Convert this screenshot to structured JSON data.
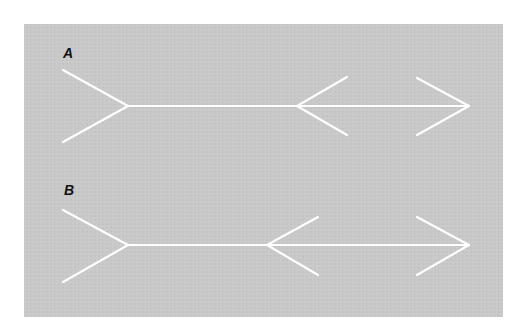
{
  "figure": {
    "background_color": "#c9c9c9",
    "line_color": "#ffffff",
    "figures": [
      {
        "label": "A",
        "label_pos": [
          63,
          47
        ],
        "shaft": [
          128,
          106,
          469,
          106
        ],
        "fins": [
          [
            63,
            70,
            128,
            106
          ],
          [
            63,
            142,
            128,
            106
          ],
          [
            297,
            106,
            347,
            77
          ],
          [
            297,
            106,
            347,
            135
          ],
          [
            417,
            78,
            469,
            106
          ],
          [
            417,
            135,
            469,
            106
          ]
        ]
      },
      {
        "label": "B",
        "label_pos": [
          64,
          184
        ],
        "shaft": [
          128,
          245,
          469,
          245
        ],
        "fins": [
          [
            63,
            210,
            128,
            245
          ],
          [
            63,
            282,
            128,
            245
          ],
          [
            267,
            245,
            318,
            217
          ],
          [
            267,
            245,
            318,
            275
          ],
          [
            417,
            217,
            469,
            245
          ],
          [
            417,
            275,
            469,
            245
          ]
        ]
      }
    ]
  }
}
